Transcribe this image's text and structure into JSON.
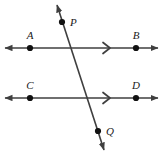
{
  "figure": {
    "background_color": "#ffffff",
    "stroke_color": "#3f3f3f",
    "label_color": "#1a1a1a",
    "width": 164,
    "height": 157
  },
  "lines": [
    {
      "name": "line-AB",
      "label": "AB",
      "kind": "parallel-line",
      "y": 48,
      "x_start": 5,
      "x_end": 158,
      "arrows": "both",
      "tick_marks": 1,
      "tick_x": 107
    },
    {
      "name": "line-CD",
      "label": "CD",
      "kind": "parallel-line",
      "y": 98,
      "x_start": 5,
      "x_end": 158,
      "arrows": "both",
      "tick_marks": 1,
      "tick_x": 107
    },
    {
      "name": "line-PQ",
      "label": "PQ",
      "kind": "transversal",
      "x_start": 57,
      "y_start": 5,
      "x_end": 104,
      "y_end": 150,
      "arrows": "both"
    }
  ],
  "points": [
    {
      "id": "A",
      "label": "A",
      "x": 30,
      "y": 48,
      "label_x": 30,
      "label_y": 39,
      "on": "line-AB"
    },
    {
      "id": "B",
      "label": "B",
      "x": 136,
      "y": 48,
      "label_x": 136,
      "label_y": 39,
      "on": "line-AB"
    },
    {
      "id": "C",
      "label": "C",
      "x": 30,
      "y": 98,
      "label_x": 30,
      "label_y": 89,
      "on": "line-CD"
    },
    {
      "id": "D",
      "label": "D",
      "x": 136,
      "y": 98,
      "label_x": 136,
      "label_y": 89,
      "on": "line-CD"
    },
    {
      "id": "P",
      "label": "P",
      "x": 62,
      "y": 22,
      "label_x": 73,
      "label_y": 23,
      "on": "line-PQ"
    },
    {
      "id": "Q",
      "label": "Q",
      "x": 98,
      "y": 131,
      "label_x": 109,
      "label_y": 134,
      "on": "line-PQ"
    }
  ]
}
